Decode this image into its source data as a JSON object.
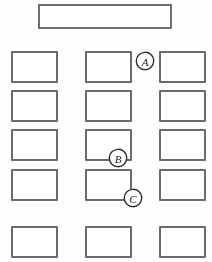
{
  "diagram": {
    "background_color": "#fdfdfc",
    "outline_color": "#6b6b6e",
    "marker_color": "#2b2b2d",
    "width": 212,
    "height": 262
  },
  "banner": {
    "label": "",
    "x": 38,
    "y": 4,
    "width": 134,
    "height": 25
  },
  "grid": {
    "columns": 3,
    "rows": 5,
    "box_width": 47,
    "box_height": 32,
    "column_x": [
      11,
      85,
      159
    ],
    "row_y": [
      51,
      90,
      129,
      169,
      226
    ],
    "boxes": [
      {
        "id": "r1c1",
        "label": "",
        "col": 1,
        "row": 1,
        "x": 11,
        "y": 51
      },
      {
        "id": "r1c2",
        "label": "",
        "col": 2,
        "row": 1,
        "x": 85,
        "y": 51
      },
      {
        "id": "r1c3",
        "label": "",
        "col": 3,
        "row": 1,
        "x": 159,
        "y": 51
      },
      {
        "id": "r2c1",
        "label": "",
        "col": 1,
        "row": 2,
        "x": 11,
        "y": 90
      },
      {
        "id": "r2c2",
        "label": "",
        "col": 2,
        "row": 2,
        "x": 85,
        "y": 90
      },
      {
        "id": "r2c3",
        "label": "",
        "col": 3,
        "row": 2,
        "x": 159,
        "y": 90
      },
      {
        "id": "r3c1",
        "label": "",
        "col": 1,
        "row": 3,
        "x": 11,
        "y": 129
      },
      {
        "id": "r3c2",
        "label": "",
        "col": 2,
        "row": 3,
        "x": 85,
        "y": 129
      },
      {
        "id": "r3c3",
        "label": "",
        "col": 3,
        "row": 3,
        "x": 159,
        "y": 129
      },
      {
        "id": "r4c1",
        "label": "",
        "col": 1,
        "row": 4,
        "x": 11,
        "y": 169
      },
      {
        "id": "r4c2",
        "label": "",
        "col": 2,
        "row": 4,
        "x": 85,
        "y": 169
      },
      {
        "id": "r4c3",
        "label": "",
        "col": 3,
        "row": 4,
        "x": 159,
        "y": 169
      },
      {
        "id": "r5c1",
        "label": "",
        "col": 1,
        "row": 5,
        "x": 11,
        "y": 226
      },
      {
        "id": "r5c2",
        "label": "",
        "col": 2,
        "row": 5,
        "x": 85,
        "y": 226
      },
      {
        "id": "r5c3",
        "label": "",
        "col": 3,
        "row": 5,
        "x": 159,
        "y": 226
      }
    ]
  },
  "markers": [
    {
      "id": "marker-a",
      "letter": "A",
      "x": 135,
      "y": 51,
      "target": "r1c3"
    },
    {
      "id": "marker-b",
      "letter": "B",
      "x": 108,
      "y": 148,
      "target": "r3c2"
    },
    {
      "id": "marker-c",
      "letter": "C",
      "x": 123,
      "y": 188,
      "target": "r4c2"
    }
  ]
}
